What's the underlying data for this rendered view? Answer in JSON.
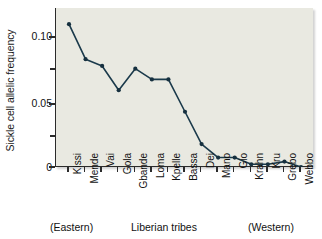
{
  "chart_data": {
    "type": "line",
    "title": "",
    "xlabel": "Liberian tribes",
    "ylabel": "Sickle cell allelic frequency",
    "categories": [
      "Kissi",
      "Mende",
      "Vai",
      "Gola",
      "Gbande",
      "Loma",
      "Kpelle",
      "Bassa",
      "Dei",
      "Mano",
      "Gio",
      "Krahn",
      "Kru",
      "Grebo",
      "Webbo"
    ],
    "values": [
      0.106,
      0.08,
      0.075,
      0.057,
      0.073,
      0.065,
      0.065,
      0.041,
      0.017,
      0.007,
      0.007,
      0.002,
      0.002,
      0.004,
      0.0
    ],
    "ylim": [
      0,
      0.118
    ],
    "ytick_values": [
      0,
      0.05,
      0.1
    ],
    "ytick_labels": [
      "0",
      "0.05",
      "0.10"
    ],
    "yminor_values": [
      0.025,
      0.075
    ],
    "grid": false,
    "legend": "none",
    "marker": "filled-circle",
    "line_color": "#1b3a4b",
    "marker_color": "#16303f",
    "plot_background": "#e9e9e1"
  },
  "annotations": {
    "left_region": "(Eastern)",
    "center_label": "Liberian tribes",
    "right_region": "(Western)"
  }
}
